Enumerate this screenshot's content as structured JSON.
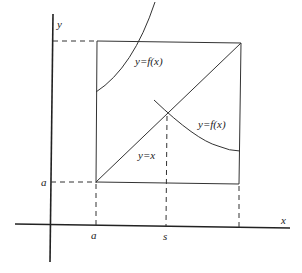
{
  "diagram": {
    "type": "fixed-point-iteration-sketch",
    "labels": {
      "y_axis": "y",
      "x_axis": "x",
      "curve_upper": "y=f(x)",
      "curve_lower": "y=f(x)",
      "diagonal": "y=x",
      "y_tick_a": "a",
      "x_tick_a": "a",
      "x_tick_s": "s"
    },
    "colors": {
      "line": "#222222",
      "background": "#ffffff"
    }
  }
}
